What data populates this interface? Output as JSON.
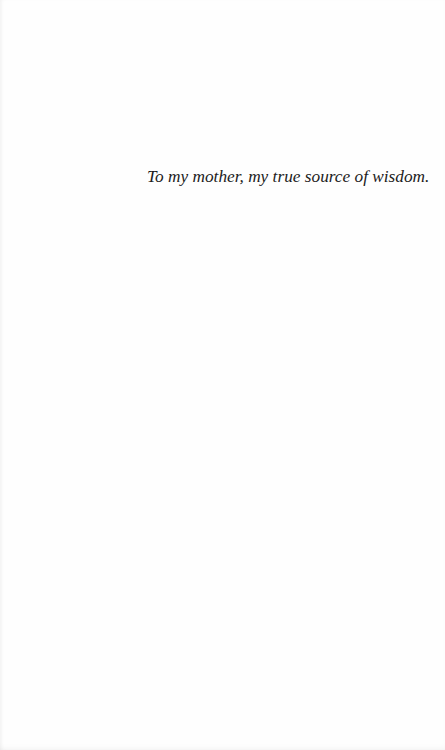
{
  "page": {
    "background_color": "#fefefe",
    "text_color": "#1c1c1c"
  },
  "dedication": {
    "text": "To my mother, my true source of wisdom."
  }
}
